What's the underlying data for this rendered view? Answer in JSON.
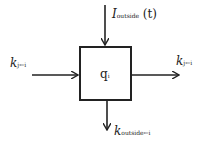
{
  "diagram": {
    "box": {
      "label": "q",
      "label_sub": "i"
    },
    "inputs": {
      "top": {
        "label": "I",
        "label_sub": "outside",
        "label_suffix": "(t)"
      },
      "left": {
        "label": "k",
        "label_sub": "j←i"
      }
    },
    "outputs": {
      "right": {
        "label": "k",
        "label_sub": "j←i"
      },
      "bottom": {
        "label": "k",
        "label_sub": "outside←i"
      }
    },
    "colors": {
      "stroke": "#222222",
      "background": "#ffffff"
    }
  }
}
